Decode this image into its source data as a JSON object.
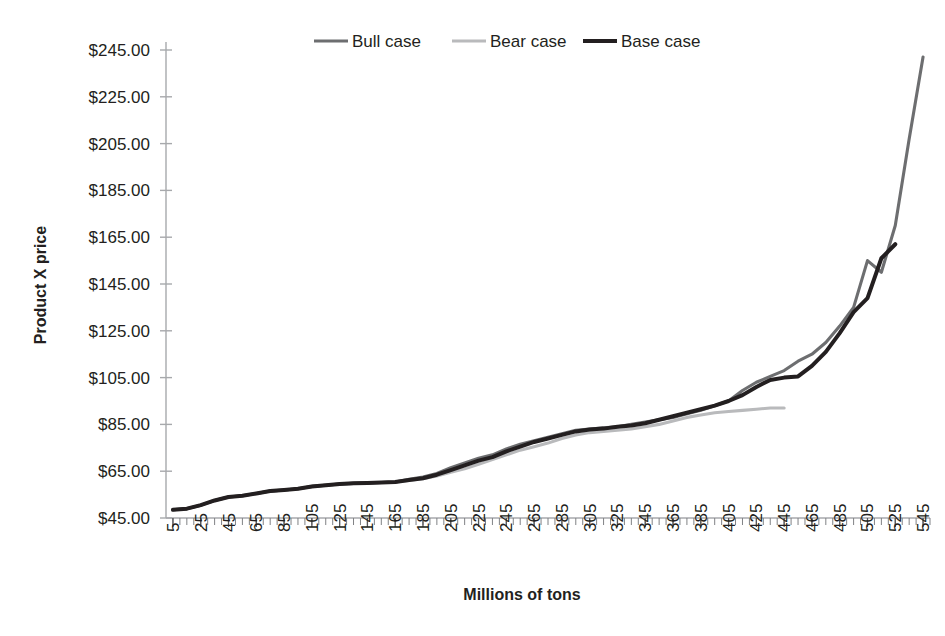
{
  "chart_data": {
    "type": "line",
    "title": "",
    "xlabel": "Millions of tons",
    "ylabel": "Product X price",
    "xlim": [
      0,
      550
    ],
    "ylim": [
      45,
      245
    ],
    "ytick_labels": [
      "$245.00",
      "$225.00",
      "$205.00",
      "$185.00",
      "$165.00",
      "$145.00",
      "$125.00",
      "$105.00",
      "$85.00",
      "$65.00",
      "$45.00"
    ],
    "ytick_values": [
      245,
      225,
      205,
      185,
      165,
      145,
      125,
      105,
      85,
      65,
      45
    ],
    "xtick_labels": [
      "5",
      "25",
      "45",
      "65",
      "85",
      "105",
      "125",
      "145",
      "165",
      "185",
      "205",
      "225",
      "245",
      "265",
      "285",
      "305",
      "325",
      "345",
      "365",
      "385",
      "405",
      "425",
      "445",
      "465",
      "485",
      "505",
      "525",
      "545"
    ],
    "xtick_values": [
      5,
      25,
      45,
      65,
      85,
      105,
      125,
      145,
      165,
      185,
      205,
      225,
      245,
      265,
      285,
      305,
      325,
      345,
      365,
      385,
      405,
      425,
      445,
      465,
      485,
      505,
      525,
      545
    ],
    "minor_tick_step": 5,
    "grid": false,
    "legend_position": "top-center",
    "series": [
      {
        "name": "Bull case",
        "color": "#6d6e70",
        "width": 3.1,
        "x": [
          5,
          15,
          25,
          35,
          45,
          55,
          65,
          75,
          85,
          95,
          105,
          115,
          125,
          135,
          145,
          155,
          165,
          175,
          185,
          195,
          205,
          215,
          225,
          235,
          245,
          255,
          265,
          275,
          285,
          295,
          305,
          315,
          325,
          335,
          345,
          355,
          365,
          375,
          385,
          395,
          405,
          415,
          425,
          435,
          445,
          455,
          465,
          475,
          485,
          495,
          505,
          515,
          525,
          535,
          545
        ],
        "y": [
          48.5,
          49.0,
          50.5,
          52.5,
          54.0,
          54.5,
          55.5,
          56.5,
          57.0,
          57.5,
          58.5,
          59.0,
          59.5,
          59.8,
          60.0,
          60.2,
          60.4,
          61.5,
          62.5,
          64.0,
          66.5,
          68.5,
          70.5,
          72.0,
          74.5,
          76.5,
          78.0,
          79.5,
          81.0,
          82.5,
          83.0,
          83.5,
          84.0,
          85.0,
          86.0,
          87.0,
          88.0,
          89.5,
          91.0,
          93.0,
          95.0,
          99.5,
          103.0,
          105.5,
          108.0,
          112.0,
          115.0,
          120.0,
          127.0,
          135.0,
          155.0,
          150.0,
          170.0,
          207.0,
          242.0
        ]
      },
      {
        "name": "Bear case",
        "color": "#b9babc",
        "width": 3.1,
        "x": [
          5,
          15,
          25,
          35,
          45,
          55,
          65,
          75,
          85,
          95,
          105,
          115,
          125,
          135,
          145,
          155,
          165,
          175,
          185,
          195,
          205,
          215,
          225,
          235,
          245,
          255,
          265,
          275,
          285,
          295,
          305,
          315,
          325,
          335,
          345,
          355,
          365,
          375,
          385,
          395,
          405,
          415,
          425,
          435,
          445
        ],
        "y": [
          48.5,
          49.0,
          50.5,
          52.5,
          54.0,
          54.5,
          55.5,
          56.5,
          57.0,
          57.5,
          58.5,
          59.0,
          59.5,
          59.8,
          60.0,
          60.2,
          60.4,
          61.0,
          61.8,
          63.0,
          64.5,
          66.0,
          68.0,
          70.0,
          72.0,
          74.0,
          75.5,
          77.0,
          79.0,
          80.5,
          81.5,
          82.0,
          82.5,
          83.0,
          84.0,
          85.0,
          86.5,
          88.0,
          89.0,
          90.0,
          90.5,
          91.0,
          91.5,
          92.0,
          92.0
        ]
      },
      {
        "name": "Base case",
        "color": "#231f20",
        "width": 4.0,
        "x": [
          5,
          15,
          25,
          35,
          45,
          55,
          65,
          75,
          85,
          95,
          105,
          115,
          125,
          135,
          145,
          155,
          165,
          175,
          185,
          195,
          205,
          215,
          225,
          235,
          245,
          255,
          265,
          275,
          285,
          295,
          305,
          315,
          325,
          335,
          345,
          355,
          365,
          375,
          385,
          395,
          405,
          415,
          425,
          435,
          445,
          455,
          465,
          475,
          485,
          495,
          505,
          515,
          525
        ],
        "y": [
          48.5,
          49.0,
          50.5,
          52.5,
          54.0,
          54.5,
          55.5,
          56.5,
          57.0,
          57.5,
          58.5,
          59.0,
          59.5,
          59.8,
          60.0,
          60.2,
          60.4,
          61.2,
          62.0,
          63.5,
          65.5,
          67.5,
          69.5,
          71.0,
          73.5,
          75.5,
          77.5,
          79.0,
          80.5,
          82.0,
          82.8,
          83.2,
          84.0,
          84.5,
          85.5,
          87.0,
          88.5,
          90.0,
          91.5,
          93.0,
          95.0,
          97.5,
          101.0,
          104.0,
          105.0,
          105.5,
          110.0,
          116.0,
          124.0,
          133.0,
          139.0,
          156.0,
          162.0
        ]
      }
    ]
  },
  "legend": {
    "items": [
      {
        "label": "Bull case",
        "color": "#6d6e70"
      },
      {
        "label": "Bear case",
        "color": "#b9babc"
      },
      {
        "label": "Base case",
        "color": "#231f20"
      }
    ]
  },
  "axes": {
    "y_title": "Product X price",
    "x_title": "Millions of tons"
  }
}
